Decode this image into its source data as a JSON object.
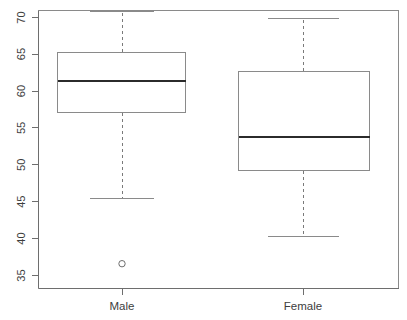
{
  "chart_data": {
    "type": "box",
    "title": "",
    "xlabel": "",
    "ylabel": "",
    "categories": [
      "Male",
      "Female"
    ],
    "ylim": [
      35,
      71.5
    ],
    "yticks": [
      35,
      40,
      45,
      50,
      55,
      60,
      65,
      70
    ],
    "ytick_labels": [
      "35",
      "40",
      "45",
      "50",
      "55",
      "60",
      "65",
      "70"
    ],
    "grid": false,
    "legend": "none",
    "orientation": "vertical",
    "box_color": "#ffffff",
    "border_color": "#8a8a8a",
    "median_color": "#2b2b2b",
    "whisker_color": "#7a7a7a",
    "whisker_style": "dashed",
    "boxes": [
      {
        "category": "Male",
        "whisker_low": 45.5,
        "q1": 57.1,
        "median": 61.4,
        "q3": 65.3,
        "whisker_high": 70.8,
        "outliers": [
          36.6
        ]
      },
      {
        "category": "Female",
        "whisker_low": 40.3,
        "q1": 49.2,
        "median": 53.8,
        "q3": 62.7,
        "whisker_high": 69.8,
        "outliers": []
      }
    ]
  },
  "axis": {
    "y_tick_0": "35",
    "y_tick_1": "40",
    "y_tick_2": "45",
    "y_tick_3": "50",
    "y_tick_4": "55",
    "y_tick_5": "60",
    "y_tick_6": "65",
    "y_tick_7": "70",
    "x_tick_0": "Male",
    "x_tick_1": "Female"
  }
}
